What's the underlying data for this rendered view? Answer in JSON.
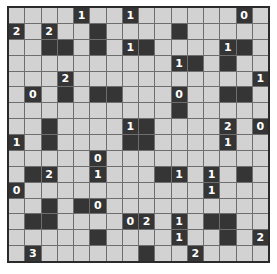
{
  "puzzle": {
    "type": "Light Up (Akari)",
    "rows": 16,
    "cols": 16,
    "grid": [
      [
        "",
        "",
        "",
        "",
        "1",
        "",
        "",
        "1",
        "",
        "",
        "",
        "",
        "",
        "",
        "0",
        ""
      ],
      [
        "2",
        "",
        "2",
        "",
        "",
        "#",
        "",
        "",
        "",
        "",
        "#",
        "",
        "",
        "",
        "",
        ""
      ],
      [
        "",
        "",
        "#",
        "#",
        "",
        "#",
        "",
        "1",
        "#",
        "",
        "",
        "",
        "",
        "1",
        "#",
        ""
      ],
      [
        "",
        "",
        "",
        "",
        "",
        "",
        "",
        "",
        "",
        "",
        "1",
        "#",
        "",
        "#",
        "",
        ""
      ],
      [
        "",
        "",
        "",
        "2",
        "",
        "",
        "",
        "",
        "",
        "",
        "",
        "",
        "",
        "",
        "",
        "1"
      ],
      [
        "",
        "0",
        "",
        "#",
        "",
        "#",
        "#",
        "",
        "",
        "",
        "0",
        "",
        "",
        "#",
        "#",
        ""
      ],
      [
        "",
        "",
        "",
        "",
        "",
        "",
        "",
        "",
        "",
        "",
        "#",
        "",
        "",
        "",
        "",
        ""
      ],
      [
        "",
        "",
        "#",
        "",
        "",
        "",
        "",
        "1",
        "#",
        "",
        "",
        "",
        "",
        "2",
        "",
        "0"
      ],
      [
        "1",
        "",
        "#",
        "",
        "",
        "",
        "",
        "#",
        "#",
        "",
        "",
        "",
        "",
        "1",
        "",
        ""
      ],
      [
        "",
        "",
        "",
        "",
        "",
        "0",
        "",
        "",
        "",
        "",
        "",
        "",
        "",
        "",
        "",
        ""
      ],
      [
        "",
        "#",
        "2",
        "",
        "",
        "1",
        "",
        "",
        "",
        "#",
        "1",
        "",
        "1",
        "",
        "#",
        ""
      ],
      [
        "0",
        "",
        "",
        "",
        "",
        "",
        "",
        "",
        "",
        "",
        "",
        "",
        "1",
        "",
        "",
        ""
      ],
      [
        "",
        "",
        "#",
        "",
        "#",
        "0",
        "",
        "",
        "",
        "",
        "",
        "",
        "",
        "",
        "",
        ""
      ],
      [
        "",
        "#",
        "#",
        "",
        "",
        "",
        "",
        "0",
        "2",
        "",
        "1",
        "",
        "#",
        "#",
        "",
        ""
      ],
      [
        "",
        "",
        "",
        "",
        "",
        "#",
        "",
        "",
        "",
        "",
        "1",
        "",
        "",
        "#",
        "",
        "2"
      ],
      [
        "",
        "3",
        "",
        "",
        "",
        "",
        "",
        "",
        "#",
        "",
        "",
        "2",
        "",
        "",
        "",
        ""
      ]
    ]
  },
  "colors": {
    "empty_cell": "#d2d2d2",
    "black_cell": "#353535",
    "grid_line": "#6e6e6e",
    "number_text": "#ffffff"
  }
}
